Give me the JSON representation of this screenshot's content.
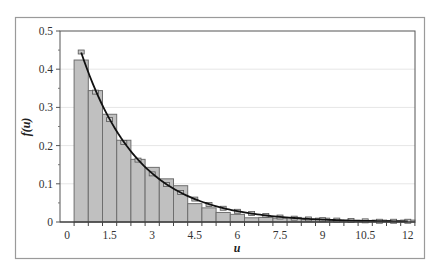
{
  "chart_data": {
    "type": "bar",
    "title": "",
    "xlabel": "u",
    "ylabel": "f(u)",
    "ylim": [
      0,
      0.5
    ],
    "xlim": [
      0,
      12
    ],
    "y_ticks": [
      "0",
      "0.1",
      "0.2",
      "0.3",
      "0.4",
      "0.5"
    ],
    "x_ticks": [
      "0",
      "1.5",
      "3",
      "4.5",
      "6",
      "7.5",
      "9",
      "10.5",
      "12"
    ],
    "grid": "horizontal",
    "legend": "none",
    "categories": [
      0.5,
      1.0,
      1.5,
      2.0,
      2.5,
      3.0,
      3.5,
      4.0,
      4.5,
      5.0,
      5.5,
      6.0,
      6.5,
      7.0,
      7.5,
      8.0,
      8.5,
      9.0,
      9.5,
      10.0,
      10.5,
      11.0,
      11.5,
      12.0
    ],
    "series": [
      {
        "name": "Observed histogram",
        "type": "bar",
        "color": "#c0c0c0",
        "values": [
          0.424,
          0.344,
          0.282,
          0.214,
          0.164,
          0.143,
          0.113,
          0.095,
          0.048,
          0.037,
          0.025,
          0.02,
          0.011,
          0.012,
          0.01,
          0.012,
          0.006,
          0.01,
          0.005,
          0.004,
          0.004,
          0.005,
          0.004,
          0.005
        ]
      },
      {
        "name": "Expected (markers)",
        "type": "marker",
        "color": "#c8c8c8",
        "values": [
          0.445,
          0.34,
          0.268,
          0.208,
          0.162,
          0.126,
          0.098,
          0.077,
          0.06,
          0.046,
          0.036,
          0.028,
          0.022,
          0.017,
          0.013,
          0.01,
          0.008,
          0.006,
          0.005,
          0.004,
          0.003,
          0.002,
          0.002,
          0.002
        ]
      },
      {
        "name": "Fitted density",
        "type": "line",
        "color": "#111111",
        "formula": "0.57*exp(-0.5*u)",
        "x": [
          0.5,
          12.0
        ]
      }
    ]
  }
}
